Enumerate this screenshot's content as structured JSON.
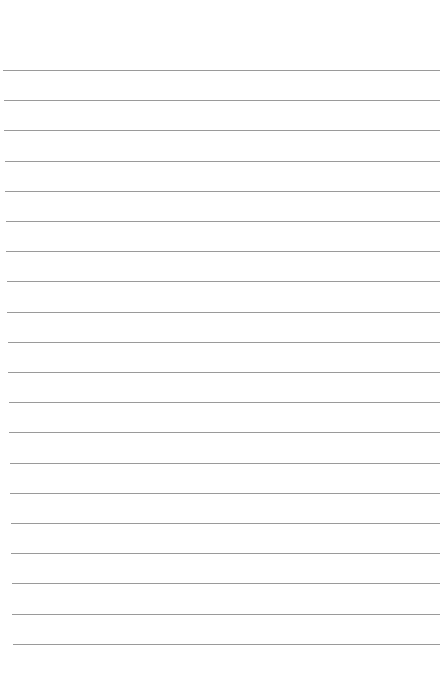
{
  "page": {
    "type": "ruled-notepaper",
    "line_count": 20,
    "first_line_y": 70,
    "line_spacing": 30.2,
    "line_color": "#9a9a9a",
    "background_color": "#ffffff"
  }
}
